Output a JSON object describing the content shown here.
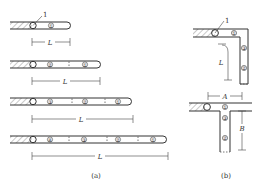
{
  "panel_a": {
    "caption": "(a)",
    "callout_label": "1",
    "dimension_label": "L",
    "rows": [
      {
        "circles": [
          "①"
        ]
      },
      {
        "circles": [
          "②",
          "①"
        ]
      },
      {
        "circles": [
          "③",
          "②",
          "①"
        ]
      },
      {
        "circles": [
          "④",
          "③",
          "②",
          "①"
        ]
      }
    ]
  },
  "panel_b": {
    "caption": "(b)",
    "callout_label": "1",
    "top": {
      "circles": [
        "①",
        "③",
        "②"
      ],
      "dimension_label": "L"
    },
    "bottom": {
      "circles": [
        "①",
        "③",
        "②"
      ],
      "dimension_labels": [
        "A",
        "B"
      ]
    }
  }
}
